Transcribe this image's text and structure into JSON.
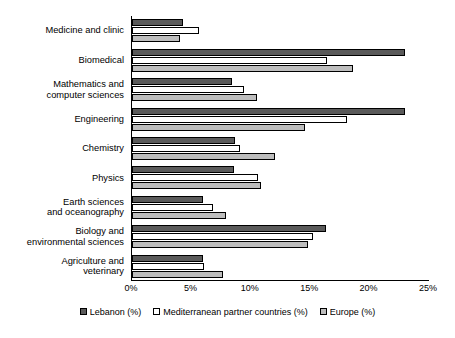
{
  "chart_data": {
    "type": "bar",
    "orientation": "horizontal",
    "title": "",
    "xlabel": "",
    "ylabel": "",
    "xlim": [
      0,
      25
    ],
    "xticks": [
      "0%",
      "5%",
      "10%",
      "15%",
      "20%",
      "25%"
    ],
    "xtick_values": [
      0,
      5,
      10,
      15,
      20,
      25
    ],
    "grid": false,
    "legend_position": "bottom",
    "categories": [
      "Medicine and clinic",
      "Biomedical",
      "Mathematics and\ncomputer sciences",
      "Engineering",
      "Chemistry",
      "Physics",
      "Earth sciences\nand oceanography",
      "Biology and\nenvironmental sciences",
      "Agriculture and\nveterinary"
    ],
    "series": [
      {
        "name": "Lebanon (%)",
        "color": "#5a5a5a",
        "values": [
          4.3,
          23.0,
          8.4,
          23.0,
          8.7,
          8.6,
          6.0,
          16.3,
          6.0
        ]
      },
      {
        "name": "Mediterranean partner countries (%)",
        "color": "#ffffff",
        "values": [
          5.6,
          16.4,
          9.4,
          18.1,
          9.1,
          10.6,
          6.8,
          15.2,
          6.1
        ]
      },
      {
        "name": "Europe (%)",
        "color": "#bdbdbd",
        "values": [
          4.0,
          18.6,
          10.5,
          14.6,
          12.0,
          10.9,
          7.9,
          14.8,
          7.7
        ]
      }
    ]
  }
}
